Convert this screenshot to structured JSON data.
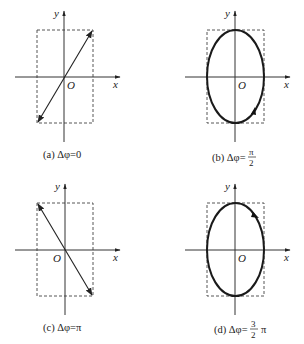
{
  "figure": {
    "axis_labels": {
      "x": "x",
      "y": "y",
      "origin": "O"
    },
    "panels": [
      {
        "id": "a",
        "caption_prefix": "(a) Δφ=",
        "caption_value": "0",
        "shape": "line-positive-slope",
        "arrows": "both-ends"
      },
      {
        "id": "b",
        "caption_prefix": "(b) Δφ=",
        "caption_num": "π",
        "caption_den": "2",
        "shape": "ellipse",
        "direction": "counterclockwise"
      },
      {
        "id": "c",
        "caption_prefix": "(c) Δφ=",
        "caption_value": "π",
        "shape": "line-negative-slope",
        "arrows": "both-ends"
      },
      {
        "id": "d",
        "caption_prefix": "(d) Δφ=",
        "caption_num": "3",
        "caption_den": "2",
        "caption_suffix": "π",
        "shape": "ellipse",
        "direction": "clockwise"
      }
    ]
  }
}
